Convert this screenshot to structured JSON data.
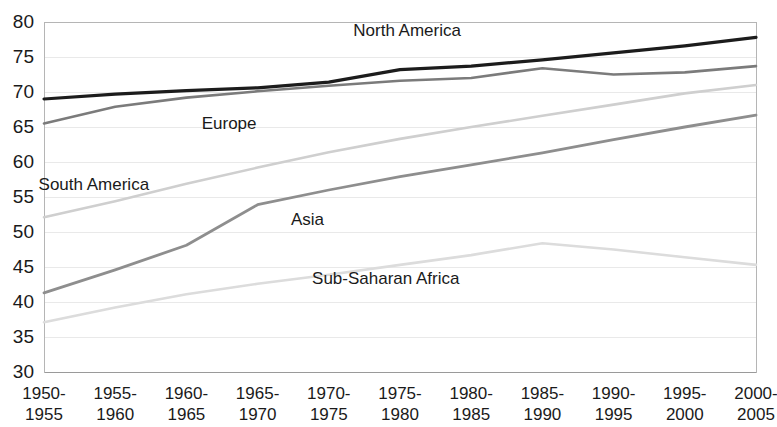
{
  "chart_data": {
    "type": "line",
    "title": "",
    "subtitle": "",
    "xlabel": "",
    "ylabel": "",
    "ylim": [
      30,
      80
    ],
    "ytick_step": 5,
    "yticks": [
      "80",
      "75",
      "70",
      "65",
      "60",
      "55",
      "50",
      "45",
      "40",
      "35",
      "30"
    ],
    "grid": true,
    "grid_axis": "y",
    "legend": "inline-labels",
    "categories": [
      "1950-\n1955",
      "1955-\n1960",
      "1960-\n1965",
      "1965-\n1970",
      "1970-\n1975",
      "1975-\n1980",
      "1980-\n1985",
      "1985-\n1990",
      "1990-\n1995",
      "1995-\n2000",
      "2000-\n2005"
    ],
    "categories_line1": [
      "1950-",
      "1955-",
      "1960-",
      "1965-",
      "1970-",
      "1975-",
      "1980-",
      "1985-",
      "1990-",
      "1995-",
      "2000-"
    ],
    "categories_line2": [
      "1955",
      "1960",
      "1965",
      "1970",
      "1975",
      "1980",
      "1985",
      "1990",
      "1995",
      "2000",
      "2005"
    ],
    "series": [
      {
        "name": "North America",
        "color": "#1c1c1c",
        "width": 3.2,
        "label_x_index": 5.1,
        "label_y": 78.6,
        "values": [
          69.0,
          69.7,
          70.2,
          70.6,
          71.4,
          73.2,
          73.7,
          74.6,
          75.6,
          76.6,
          77.8
        ]
      },
      {
        "name": "Europe",
        "color": "#7b7b7b",
        "width": 2.6,
        "label_x_index": 2.6,
        "label_y": 65.3,
        "values": [
          65.5,
          67.9,
          69.2,
          70.1,
          70.9,
          71.6,
          72.0,
          73.4,
          72.5,
          72.8,
          73.7
        ]
      },
      {
        "name": "South America",
        "color": "#cfcfcf",
        "width": 2.6,
        "label_x_index": 0.7,
        "label_y": 56.6,
        "values": [
          52.1,
          54.4,
          56.9,
          59.2,
          61.4,
          63.3,
          65.0,
          66.6,
          68.2,
          69.8,
          71.0
        ]
      },
      {
        "name": "Asia",
        "color": "#8e8e8e",
        "width": 2.8,
        "label_x_index": 3.7,
        "label_y": 51.6,
        "values": [
          41.3,
          44.6,
          48.1,
          53.9,
          56.0,
          57.9,
          59.6,
          61.3,
          63.2,
          65.0,
          66.7
        ]
      },
      {
        "name": "Sub-Saharan Africa",
        "color": "#dcdcdc",
        "width": 2.6,
        "label_x_index": 4.8,
        "label_y": 43.2,
        "values": [
          37.1,
          39.2,
          41.1,
          42.6,
          43.9,
          45.3,
          46.7,
          48.4,
          47.5,
          46.4,
          45.3
        ]
      }
    ]
  },
  "plot": {
    "left": 44,
    "right": 756,
    "top": 22,
    "bottom": 372
  }
}
